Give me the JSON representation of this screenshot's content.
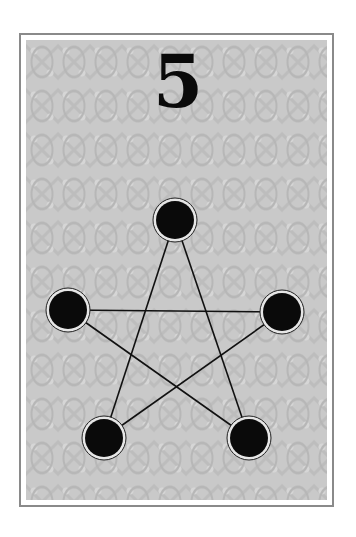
{
  "card": {
    "value": "5",
    "pip_count": 5,
    "colors": {
      "border": "#8a8a8a",
      "pattern": "#c9c9c9",
      "pip": "#0a0a0a",
      "line": "#111111"
    },
    "pips": [
      {
        "name": "top",
        "cx": 175,
        "cy": 220
      },
      {
        "name": "left",
        "cx": 68,
        "cy": 310
      },
      {
        "name": "right",
        "cx": 282,
        "cy": 312
      },
      {
        "name": "bottom-left",
        "cx": 104,
        "cy": 438
      },
      {
        "name": "bottom-right",
        "cx": 249,
        "cy": 438
      }
    ]
  }
}
